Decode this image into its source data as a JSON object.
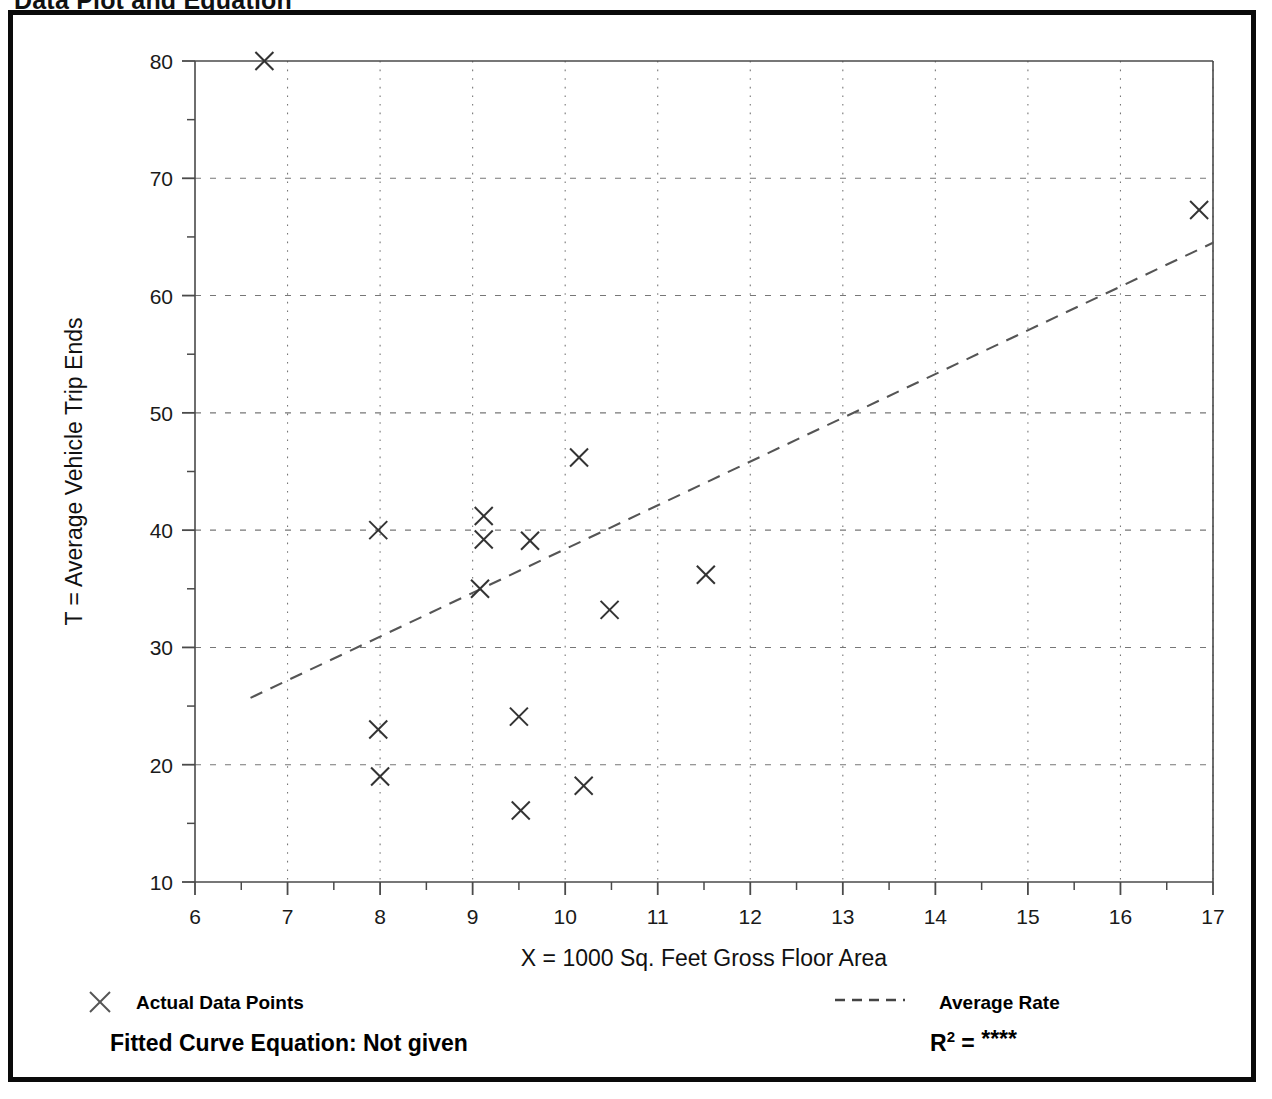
{
  "document": {
    "title": "Data Plot and Equation"
  },
  "chart_data": {
    "type": "scatter",
    "title": "Data Plot and Equation",
    "xlabel": "X = 1000 Sq. Feet Gross Floor Area",
    "ylabel": "T = Average Vehicle Trip Ends",
    "xlim": [
      6,
      17
    ],
    "ylim": [
      10,
      80
    ],
    "x_ticks": [
      6,
      7,
      8,
      9,
      10,
      11,
      12,
      13,
      14,
      15,
      16,
      17
    ],
    "x_tick_labels": [
      "6",
      "7",
      "8",
      "9",
      "10",
      "11",
      "12",
      "13",
      "14",
      "15",
      "16",
      "17"
    ],
    "x_minor_step": 0.5,
    "y_ticks": [
      10,
      20,
      30,
      40,
      50,
      60,
      70,
      80
    ],
    "y_tick_labels": [
      "10",
      "20",
      "30",
      "40",
      "50",
      "60",
      "70",
      "80"
    ],
    "y_minor_step": 5,
    "grid": "dotted-major-both",
    "legend_position": "below-plot",
    "series": [
      {
        "name": "Actual Data Points",
        "marker": "x",
        "points": [
          {
            "x": 6.75,
            "y": 80.0
          },
          {
            "x": 7.98,
            "y": 40.0
          },
          {
            "x": 7.98,
            "y": 23.0
          },
          {
            "x": 8.0,
            "y": 19.0
          },
          {
            "x": 9.08,
            "y": 35.0
          },
          {
            "x": 9.12,
            "y": 41.2
          },
          {
            "x": 9.12,
            "y": 39.2
          },
          {
            "x": 9.5,
            "y": 24.1
          },
          {
            "x": 9.52,
            "y": 16.1
          },
          {
            "x": 9.62,
            "y": 39.1
          },
          {
            "x": 10.15,
            "y": 46.2
          },
          {
            "x": 10.2,
            "y": 18.2
          },
          {
            "x": 10.48,
            "y": 33.2
          },
          {
            "x": 11.52,
            "y": 36.2
          },
          {
            "x": 16.85,
            "y": 67.3
          }
        ]
      },
      {
        "name": "Average Rate",
        "style": "dashed-line",
        "endpoints": [
          {
            "x": 6.6,
            "y": 25.7
          },
          {
            "x": 17.0,
            "y": 64.5
          }
        ]
      }
    ],
    "annotations": {
      "fitted_curve_equation_label": "Fitted Curve Equation:",
      "fitted_curve_equation_value": "Not given",
      "r_squared_label": "R",
      "r_squared_exponent": "2",
      "r_squared_equals": "=",
      "r_squared_value": "****"
    }
  },
  "legend": {
    "data_points": {
      "marker": "x-marker",
      "label": "Actual Data Points"
    },
    "average_rate": {
      "marker": "dashed-line",
      "label": "Average Rate"
    }
  },
  "colors": {
    "frame": "#0a0a0a",
    "axis": "#4a4a4a",
    "grid": "#777777",
    "marker": "#333333",
    "trend": "#555555",
    "text": "#000000",
    "background": "#ffffff"
  }
}
